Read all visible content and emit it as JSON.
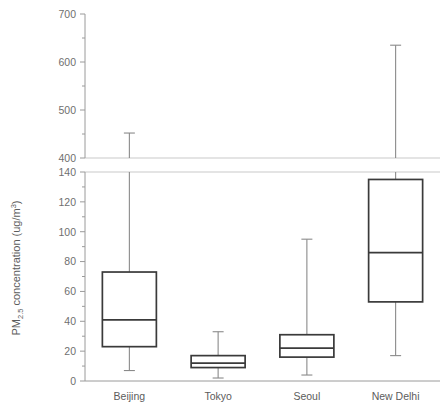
{
  "chart_data": {
    "type": "box",
    "title": "",
    "xlabel": "",
    "ylabel": "PM2.5 concentration (ug/m3)",
    "ylabel_parts": {
      "prefix": "PM",
      "subscript": "2.5",
      "middle": " concentration (ug/m",
      "superscript": "3",
      "suffix": ")"
    },
    "broken_axis": true,
    "grid": false,
    "legend": "none",
    "lower_panel": {
      "ylim": [
        0,
        140
      ],
      "major_ticks": [
        0,
        20,
        40,
        60,
        80,
        100,
        120,
        140
      ],
      "minor_tick_step": 10,
      "tick_labels": [
        "0",
        "20",
        "40",
        "60",
        "80",
        "100",
        "120",
        "140"
      ]
    },
    "upper_panel": {
      "ylim": [
        400,
        700
      ],
      "major_ticks": [
        400,
        500,
        600,
        700
      ],
      "minor_tick_step": 50,
      "tick_labels": [
        "400",
        "500",
        "600",
        "700"
      ]
    },
    "categories": [
      "Beijing",
      "Tokyo",
      "Seoul",
      "New Delhi"
    ],
    "boxes": [
      {
        "name": "Beijing",
        "whisker_low": 7,
        "q1": 23,
        "median": 41,
        "q3": 73,
        "whisker_high": 452
      },
      {
        "name": "Tokyo",
        "whisker_low": 2,
        "q1": 9,
        "median": 12,
        "q3": 17,
        "whisker_high": 33
      },
      {
        "name": "Seoul",
        "whisker_low": 4,
        "q1": 16,
        "median": 22,
        "q3": 31,
        "whisker_high": 95
      },
      {
        "name": "New Delhi",
        "whisker_low": 17,
        "q1": 53,
        "median": 86,
        "q3": 135,
        "whisker_high": 635
      }
    ],
    "colors": {
      "box_stroke": "#3a3a3a",
      "whisker_stroke": "#8a8a8a",
      "axis": "#9a9a9a",
      "panel_border": "#c9c9c9",
      "text": "#6f6f6f",
      "background": "#ffffff"
    }
  }
}
